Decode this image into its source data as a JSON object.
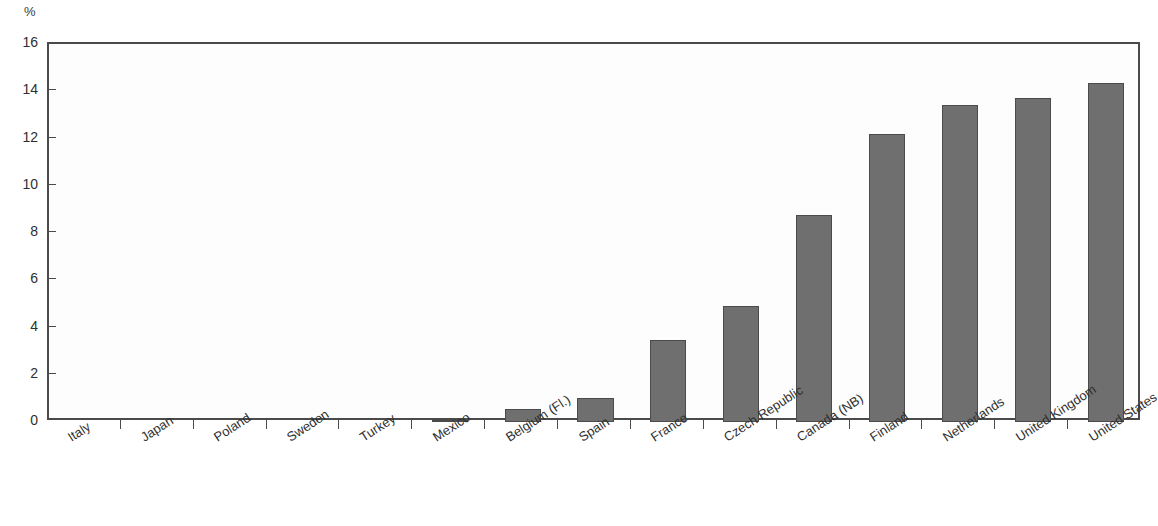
{
  "chart": {
    "title": "",
    "unit_label": "%"
  },
  "chart_data": {
    "type": "bar",
    "title": "",
    "xlabel": "",
    "ylabel": "%",
    "ylim": [
      0,
      16
    ],
    "yticks": [
      0,
      2,
      4,
      6,
      8,
      10,
      12,
      14,
      16
    ],
    "ytick_labels": [
      "0",
      "2",
      "4",
      "6",
      "8",
      "10",
      "12",
      "14",
      "16"
    ],
    "grid": false,
    "legend": null,
    "bar_color": "#6f6f6f",
    "bar_edge_color": "#4b4b4b",
    "categories": [
      "Italy",
      "Japan",
      "Poland",
      "Sweden",
      "Turkey",
      "Mexico",
      "Belgium (Fl.)",
      "Spain",
      "France",
      "Czech Republic",
      "Canada (NB)",
      "Finland",
      "Netherlands",
      "United Kingdom",
      "United States"
    ],
    "values": [
      0,
      0,
      0,
      0,
      0,
      0.1,
      0.55,
      1.0,
      3.45,
      4.9,
      8.75,
      12.2,
      13.4,
      13.7,
      14.35
    ]
  }
}
